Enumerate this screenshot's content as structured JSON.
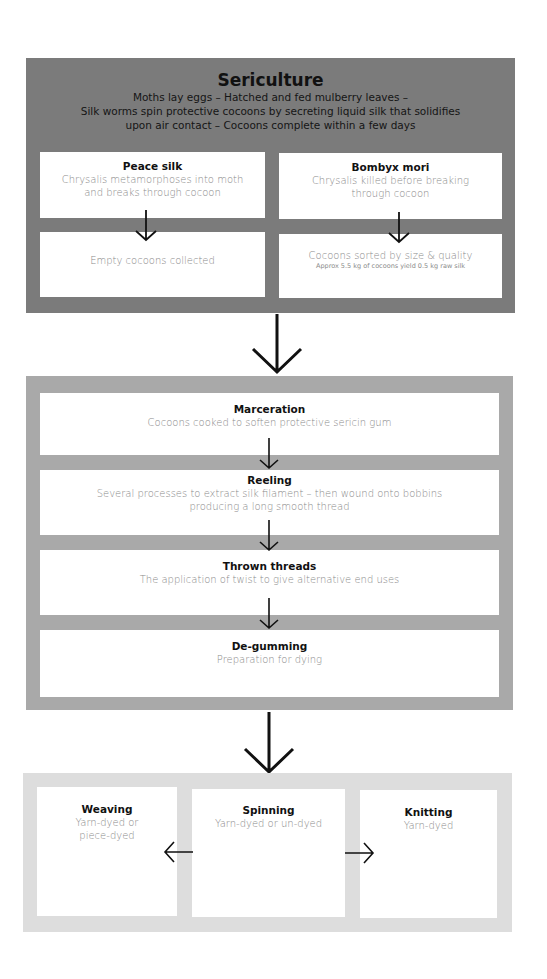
{
  "sericulture": {
    "title": "Sericulture",
    "intro_lines": [
      "Moths lay eggs – Hatched and fed mulberry leaves –",
      "Silk worms spin protective cocoons by secreting liquid silk that solidifies",
      "upon air contact – Cocoons complete within a few days"
    ],
    "peace_silk": {
      "title": "Peace silk",
      "desc_lines": [
        "Chrysalis metamorphoses into moth",
        "and breaks through cocoon"
      ],
      "result": "Empty cocoons collected"
    },
    "bombyx_mori": {
      "title": "Bombyx mori",
      "desc_lines": [
        "Chrysalis killed before breaking",
        "through cocoon"
      ],
      "result": "Cocoons sorted by size & quality",
      "note": "Approx 5.5 kg of cocoons yield 0.5 kg raw silk"
    }
  },
  "processing": {
    "steps": [
      {
        "title": "Marceration",
        "desc_lines": [
          "Cocoons cooked to soften protective sericin gum"
        ]
      },
      {
        "title": "Reeling",
        "desc_lines": [
          "Several processes to extract silk filament – then wound onto bobbins",
          "producing a long smooth thread"
        ]
      },
      {
        "title": "Thrown threads",
        "desc_lines": [
          "The application of twist to give alternative end uses"
        ]
      },
      {
        "title": "De-gumming",
        "desc_lines": [
          "Preparation for dying"
        ]
      }
    ]
  },
  "end_uses": {
    "weaving": {
      "title": "Weaving",
      "desc_lines": [
        "Yarn-dyed or",
        "piece-dyed"
      ]
    },
    "spinning": {
      "title": "Spinning",
      "desc_lines": [
        "Yarn-dyed or un-dyed"
      ]
    },
    "knitting": {
      "title": "Knitting",
      "desc_lines": [
        "Yarn-dyed"
      ]
    }
  },
  "colors": {
    "panel_top": "#7b7b7b",
    "panel_mid": "#a9a9a9",
    "panel_bottom": "#dddddd",
    "box": "#ffffff",
    "title_text": "#111111",
    "desc_text": "#8a8a8a"
  }
}
